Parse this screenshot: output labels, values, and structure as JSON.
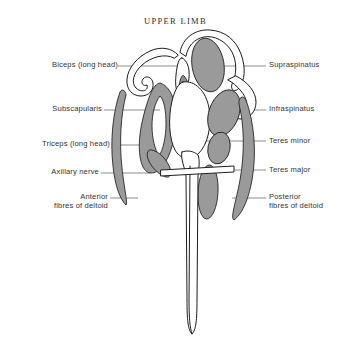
{
  "figure": {
    "title": "UPPER LIMB",
    "type": "anatomical-cross-section",
    "region": "shoulder",
    "background_color": "#ffffff",
    "muscle_fill_color": "#9a9a9a",
    "outline_color": "#1d1d22",
    "leader_line_color": "#5c5c66"
  },
  "labels_left": [
    {
      "id": "biceps-long-head",
      "text": "Biceps (long head)",
      "lines": [
        "Biceps (long head)"
      ],
      "x": 14,
      "y": 60,
      "leader_y": 66
    },
    {
      "id": "subscapularis",
      "text": "Subscapularis",
      "lines": [
        "Subscapularis"
      ],
      "x": 14,
      "y": 104,
      "leader_y": 110
    },
    {
      "id": "triceps-long-head",
      "text": "Triceps (long head)",
      "lines": [
        "Triceps (long head)"
      ],
      "x": 14,
      "y": 139,
      "leader_y": 145
    },
    {
      "id": "axillary-nerve",
      "text": "Axillary nerve",
      "lines": [
        "Axillary nerve"
      ],
      "x": 14,
      "y": 167,
      "leader_y": 173
    },
    {
      "id": "anterior-fibres-of-deltoid",
      "text": "Anterior fibres of deltoid",
      "lines": [
        "Anterior",
        "fibres of deltoid"
      ],
      "x": 14,
      "y": 192,
      "leader_y": 198
    }
  ],
  "labels_right": [
    {
      "id": "supraspinatus",
      "text": "Supraspinatus",
      "lines": [
        "Supraspinatus"
      ],
      "x": 269,
      "y": 60,
      "leader_y": 66
    },
    {
      "id": "infraspinatus",
      "text": "Infraspinatus",
      "lines": [
        "Infraspinatus"
      ],
      "x": 269,
      "y": 104,
      "leader_y": 110
    },
    {
      "id": "teres-minor",
      "text": "Teres minor",
      "lines": [
        "Teres minor"
      ],
      "x": 269,
      "y": 136,
      "leader_y": 141
    },
    {
      "id": "teres-major",
      "text": "Teres major",
      "lines": [
        "Teres major"
      ],
      "x": 269,
      "y": 165,
      "leader_y": 170
    },
    {
      "id": "posterior-fibres-of-deltoid",
      "text": "Posterior fibres of deltoid",
      "lines": [
        "Posterior",
        "fibres of deltoid"
      ],
      "x": 269,
      "y": 192,
      "leader_y": 198
    }
  ],
  "structures": [
    {
      "id": "acromion-clavicle",
      "name": "acromion and clavicle outline",
      "shaded": false
    },
    {
      "id": "humeral-head",
      "name": "head of humerus",
      "shaded": false
    },
    {
      "id": "humeral-shaft",
      "name": "shaft of humerus",
      "shaded": false
    },
    {
      "id": "biceps-long-head",
      "name": "Biceps (long head)",
      "shaded": false
    },
    {
      "id": "supraspinatus",
      "name": "Supraspinatus",
      "shaded": true
    },
    {
      "id": "subscapularis",
      "name": "Subscapularis",
      "shaded": true
    },
    {
      "id": "infraspinatus",
      "name": "Infraspinatus",
      "shaded": true
    },
    {
      "id": "teres-minor",
      "name": "Teres minor",
      "shaded": true
    },
    {
      "id": "teres-major",
      "name": "Teres major",
      "shaded": true
    },
    {
      "id": "triceps-long-head",
      "name": "Triceps (long head)",
      "shaded": true
    },
    {
      "id": "anterior-deltoid",
      "name": "Anterior fibres of deltoid",
      "shaded": true
    },
    {
      "id": "posterior-deltoid",
      "name": "Posterior fibres of deltoid",
      "shaded": true
    },
    {
      "id": "axillary-nerve",
      "name": "Axillary nerve",
      "shaded": false
    }
  ]
}
